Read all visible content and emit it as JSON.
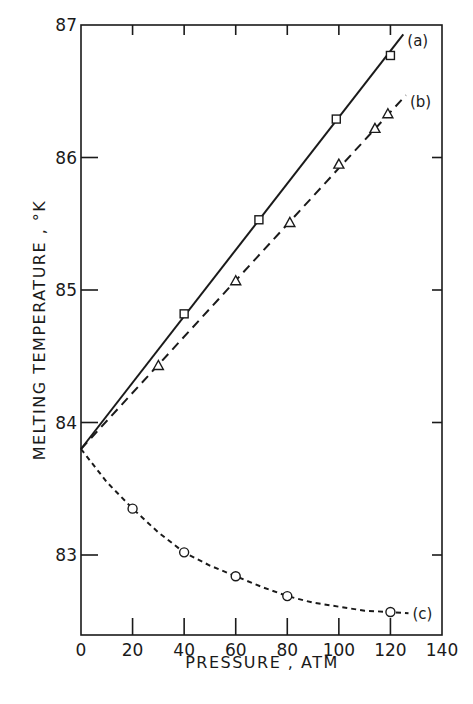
{
  "chart_data": {
    "type": "line",
    "title": "",
    "xlabel": "PRESSURE ,  ATM",
    "ylabel": "MELTING TEMPERATURE , °K",
    "xlim": [
      0,
      140
    ],
    "ylim": [
      82.4,
      87
    ],
    "xticks": [
      0,
      20,
      40,
      60,
      80,
      100,
      120,
      140
    ],
    "xtick_labels": [
      "0",
      "20",
      "40",
      "60",
      "80",
      "100",
      "120",
      "140"
    ],
    "yticks": [
      83,
      84,
      85,
      86,
      87
    ],
    "ytick_labels": [
      "83",
      "84",
      "85",
      "86",
      "87"
    ],
    "grid": false,
    "legend": "inline labels at line ends",
    "series": [
      {
        "name": "(a)",
        "marker": "square",
        "line_style": "solid",
        "points": [
          [
            40,
            84.82
          ],
          [
            69,
            85.53
          ],
          [
            99,
            86.29
          ],
          [
            120,
            86.77
          ]
        ],
        "fit_line": [
          [
            0,
            83.8
          ],
          [
            125,
            86.93
          ]
        ]
      },
      {
        "name": "(b)",
        "marker": "triangle",
        "line_style": "dashed",
        "points": [
          [
            30,
            84.43
          ],
          [
            60,
            85.07
          ],
          [
            81,
            85.51
          ],
          [
            100,
            85.95
          ],
          [
            114,
            86.22
          ],
          [
            119,
            86.33
          ]
        ],
        "fit_line": [
          [
            0,
            83.8
          ],
          [
            126,
            86.47
          ]
        ]
      },
      {
        "name": "(c)",
        "marker": "circle",
        "line_style": "dotted",
        "points": [
          [
            20,
            83.35
          ],
          [
            40,
            83.02
          ],
          [
            60,
            82.84
          ],
          [
            80,
            82.69
          ],
          [
            120,
            82.57
          ]
        ],
        "fit_curve": [
          [
            0,
            83.8
          ],
          [
            10,
            83.55
          ],
          [
            20,
            83.35
          ],
          [
            30,
            83.17
          ],
          [
            40,
            83.02
          ],
          [
            50,
            82.92
          ],
          [
            60,
            82.84
          ],
          [
            70,
            82.76
          ],
          [
            80,
            82.69
          ],
          [
            90,
            82.64
          ],
          [
            100,
            82.61
          ],
          [
            110,
            82.58
          ],
          [
            120,
            82.57
          ],
          [
            127,
            82.56
          ]
        ]
      }
    ]
  }
}
